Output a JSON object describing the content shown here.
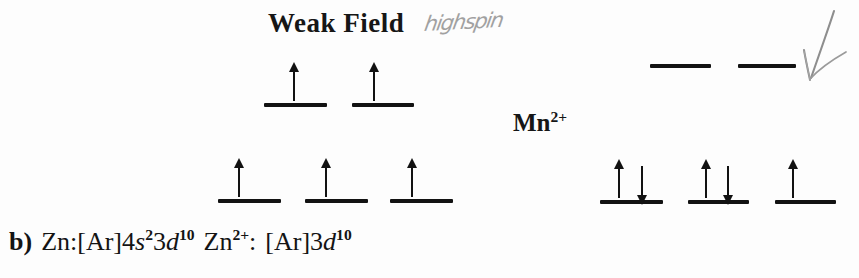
{
  "figure": {
    "type": "orbital-diagram",
    "background_color": "#fdfdfd",
    "ink_color": "#121212",
    "pencil_color": "#9a9a9a"
  },
  "weak_field": {
    "title": "Weak Field",
    "handwritten_note": "highspin"
  },
  "ion": {
    "label_text": "Mn",
    "label_charge": "2+"
  },
  "diagrams": [
    {
      "name": "weak-field-upper-set",
      "orbital_count": 2,
      "electrons_per_orbital": [
        1,
        1
      ],
      "spins": [
        [
          "up"
        ],
        [
          "up"
        ]
      ]
    },
    {
      "name": "weak-field-lower-set",
      "orbital_count": 3,
      "electrons_per_orbital": [
        1,
        1,
        1
      ],
      "spins": [
        [
          "up"
        ],
        [
          "up"
        ],
        [
          "up"
        ]
      ]
    },
    {
      "name": "strong-field-upper-set",
      "orbital_count": 2,
      "electrons_per_orbital": [
        0,
        0
      ],
      "spins": [
        [],
        []
      ]
    },
    {
      "name": "strong-field-lower-set",
      "orbital_count": 3,
      "electrons_per_orbital": [
        2,
        2,
        1
      ],
      "spins": [
        [
          "up",
          "down"
        ],
        [
          "up",
          "down"
        ],
        [
          "up"
        ]
      ]
    }
  ],
  "annotations": {
    "pencil_arrow": "down-left-arrow"
  },
  "config_text": {
    "item_label": "b)",
    "neutral_atom": "Zn:",
    "neutral_config_bracket": "[Ar]",
    "neutral_config_s_coeff": "4",
    "neutral_config_s_sym": "s",
    "neutral_config_s_exp": "2",
    "neutral_config_d_coeff": "3",
    "neutral_config_d_sym": "d",
    "neutral_config_d_exp": "10",
    "ion_atom": "Zn",
    "ion_charge": "2+",
    "ion_colon": ":",
    "ion_config_bracket": "[Ar]",
    "ion_config_d_coeff": "3",
    "ion_config_d_sym": "d",
    "ion_config_d_exp": "10",
    "full_text": "b) Zn:[Ar]4s23d10 Zn2+: [Ar]3d10"
  }
}
